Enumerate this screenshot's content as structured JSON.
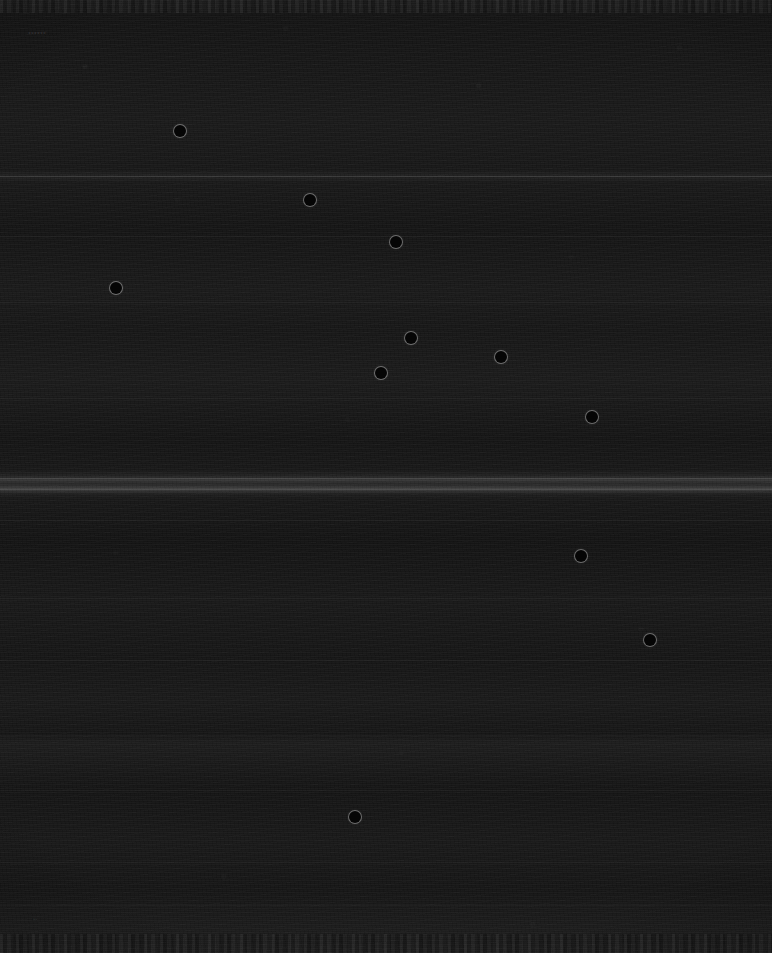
{
  "view": {
    "title": "Dark Scan View",
    "width": 772,
    "height": 953,
    "background_color": "#141414",
    "marker_color": "#050505",
    "marker_rim_color": "#d2d2d2"
  },
  "labels": {
    "top_left": "••••••",
    "bottom_left": "••"
  },
  "chart_data": {
    "type": "scatter",
    "xlabel": "",
    "ylabel": "",
    "xlim": [
      0,
      772
    ],
    "ylim": [
      0,
      953
    ],
    "grid": false,
    "legend": "none",
    "marker_diameter": 12,
    "points": [
      {
        "x": 180,
        "y": 131
      },
      {
        "x": 310,
        "y": 200
      },
      {
        "x": 396,
        "y": 242
      },
      {
        "x": 116,
        "y": 288
      },
      {
        "x": 411,
        "y": 338
      },
      {
        "x": 501,
        "y": 357
      },
      {
        "x": 381,
        "y": 373
      },
      {
        "x": 592,
        "y": 417
      },
      {
        "x": 581,
        "y": 556
      },
      {
        "x": 650,
        "y": 640
      },
      {
        "x": 355,
        "y": 817
      }
    ],
    "separators": [
      {
        "y": 176,
        "weight": "strong"
      },
      {
        "y": 236,
        "weight": "soft"
      },
      {
        "y": 302,
        "weight": "soft"
      },
      {
        "y": 398,
        "weight": "soft"
      },
      {
        "y": 478,
        "weight": "strong"
      },
      {
        "y": 489,
        "weight": "strong"
      },
      {
        "y": 520,
        "weight": "soft"
      },
      {
        "y": 598,
        "weight": "soft"
      },
      {
        "y": 660,
        "weight": "soft"
      },
      {
        "y": 735,
        "weight": "soft"
      },
      {
        "y": 790,
        "weight": "soft"
      },
      {
        "y": 862,
        "weight": "soft"
      },
      {
        "y": 905,
        "weight": "soft"
      }
    ]
  }
}
